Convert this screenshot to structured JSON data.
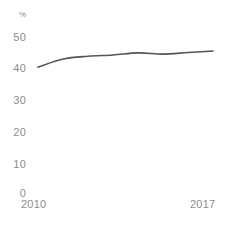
{
  "chart_data": {
    "type": "line",
    "title": "",
    "subtitle": "",
    "xlabel": "",
    "ylabel": "%",
    "unit_label": "%",
    "grid": false,
    "legend": null,
    "legend_position": "none",
    "line_color": "#555555",
    "axis_label_color": "#8c8c8c",
    "background_color": "#ffffff",
    "xlim": [
      2010,
      2017
    ],
    "ylim": [
      0,
      50
    ],
    "x_tick_labels": [
      "2010",
      "2017"
    ],
    "y_tick_labels": [
      "0",
      "10",
      "20",
      "30",
      "40",
      "50"
    ],
    "y_ticks": [
      0,
      10,
      20,
      30,
      40,
      50
    ],
    "x": [
      2010,
      2011,
      2012,
      2013,
      2014,
      2015,
      2016,
      2017
    ],
    "categories": [
      "2010",
      "2011",
      "2012",
      "2013",
      "2014",
      "2015",
      "2016",
      "2017"
    ],
    "values": [
      40.0,
      42.6,
      43.5,
      43.9,
      44.6,
      44.2,
      44.7,
      45.2
    ],
    "series": [
      {
        "name": "",
        "values": [
          40.0,
          42.6,
          43.5,
          43.9,
          44.6,
          44.2,
          44.7,
          45.2
        ]
      }
    ],
    "annotations": []
  }
}
